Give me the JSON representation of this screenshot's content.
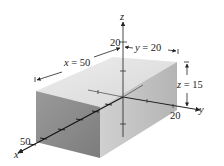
{
  "figure": {
    "axes": {
      "x_label": "x",
      "y_label": "y",
      "z_label": "z",
      "x_tick_label": "50",
      "y_tick_label": "20",
      "z_tick_label": "20"
    },
    "dimensions": {
      "x": {
        "var": "x",
        "eq": " = ",
        "value": "50"
      },
      "y": {
        "var": "y",
        "eq": " = ",
        "value": "20"
      },
      "z": {
        "var": "z",
        "eq": " = ",
        "value": "15"
      }
    },
    "colors": {
      "top_face": "#e2e2e2",
      "front_face": "#8c8c8c",
      "right_face": "#c4c4c4",
      "axis": "#222222"
    }
  }
}
